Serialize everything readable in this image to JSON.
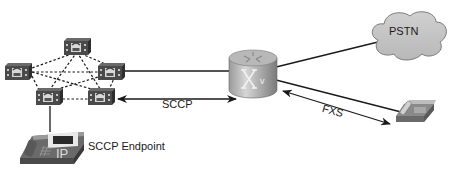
{
  "diagram": {
    "labels": {
      "sccp": "SCCP",
      "sccp_endpoint": "SCCP Endpoint",
      "pstn": "PSTN",
      "fxs": "FXS"
    },
    "nodes": [
      {
        "id": "cucm-top",
        "type": "call-manager-server"
      },
      {
        "id": "cucm-left",
        "type": "call-manager-server"
      },
      {
        "id": "cucm-right",
        "type": "call-manager-server"
      },
      {
        "id": "cucm-bottom-left",
        "type": "call-manager-server"
      },
      {
        "id": "cucm-bottom-right",
        "type": "call-manager-server"
      },
      {
        "id": "voice-router",
        "type": "voice-gateway-router"
      },
      {
        "id": "pstn",
        "type": "cloud",
        "label": "PSTN"
      },
      {
        "id": "analog-phone",
        "type": "analog-telephone"
      },
      {
        "id": "ip-phone",
        "type": "ip-phone",
        "label": "SCCP Endpoint"
      }
    ],
    "links": [
      {
        "from": "cucm-right",
        "to": "voice-router",
        "style": "solid"
      },
      {
        "from": "voice-router",
        "to": "pstn",
        "style": "solid"
      },
      {
        "from": "voice-router",
        "to": "analog-phone",
        "style": "solid"
      },
      {
        "from": "cucm-bottom-left",
        "to": "ip-phone",
        "style": "solid"
      },
      {
        "from": "cucm-bottom-right",
        "to": "voice-router",
        "style": "double-arrow",
        "label": "SCCP"
      },
      {
        "from": "voice-router",
        "to": "analog-phone",
        "style": "double-arrow",
        "label": "FXS"
      }
    ],
    "colors": {
      "device_dark": "#3f3f3f",
      "device_mid": "#8a8a8a",
      "device_light": "#c8c8c8",
      "cloud_fill": "#c4c4c4",
      "line": "#1a1a1a"
    }
  }
}
